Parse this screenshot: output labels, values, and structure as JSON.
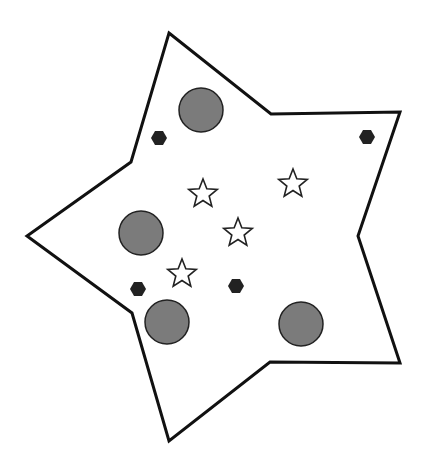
{
  "diagram": {
    "width": 426,
    "height": 472,
    "background": "#ffffff",
    "outline": {
      "shape": "five-point-star-polygon",
      "stroke": "#111111",
      "stroke_width": 3,
      "fill": "none",
      "points": [
        [
          169,
          33
        ],
        [
          271,
          114
        ],
        [
          400,
          112
        ],
        [
          358,
          236
        ],
        [
          400,
          363
        ],
        [
          270,
          362
        ],
        [
          169,
          441
        ],
        [
          132,
          313
        ],
        [
          27,
          236
        ],
        [
          131,
          162
        ]
      ]
    },
    "circles": {
      "fill": "#7b7b7b",
      "stroke": "#222222",
      "radius": 22,
      "items": [
        {
          "cx": 201,
          "cy": 110
        },
        {
          "cx": 141,
          "cy": 233
        },
        {
          "cx": 167,
          "cy": 322
        },
        {
          "cx": 301,
          "cy": 324
        }
      ]
    },
    "hexagons": {
      "fill": "#222222",
      "radius": 8,
      "items": [
        {
          "cx": 159,
          "cy": 138
        },
        {
          "cx": 367,
          "cy": 137
        },
        {
          "cx": 138,
          "cy": 289
        },
        {
          "cx": 236,
          "cy": 286
        }
      ]
    },
    "stars": {
      "fill": "#ffffff",
      "stroke": "#222222",
      "outer_radius": 15,
      "inner_radius": 6.5,
      "items": [
        {
          "cx": 203,
          "cy": 193
        },
        {
          "cx": 293,
          "cy": 183
        },
        {
          "cx": 238,
          "cy": 232
        },
        {
          "cx": 182,
          "cy": 273
        }
      ]
    }
  }
}
